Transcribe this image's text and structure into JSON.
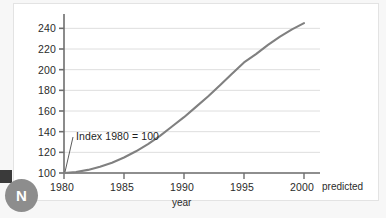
{
  "badge": {
    "letter": "N",
    "name": "n-logo-badge"
  },
  "chart_data": {
    "type": "line",
    "title": "",
    "xlabel": "year",
    "ylabel": "",
    "annotation": "Index 1980 = 100",
    "predicted_note": "predicted",
    "grid": true,
    "legend": "none",
    "xlim": [
      1980,
      2000
    ],
    "ylim": [
      100,
      250
    ],
    "xticks": [
      1980,
      1985,
      1990,
      1995,
      2000
    ],
    "xticklabels": [
      "1980",
      "1985",
      "1990",
      "1995",
      "2000"
    ],
    "yticks": [
      100,
      120,
      140,
      160,
      180,
      200,
      220,
      240
    ],
    "yticklabels": [
      "100",
      "120",
      "140",
      "160",
      "180",
      "200",
      "220",
      "240"
    ],
    "series": [
      {
        "name": "index",
        "color": "#808080",
        "x": [
          1980,
          1981,
          1982,
          1983,
          1984,
          1985,
          1986,
          1987,
          1988,
          1989,
          1990,
          1991,
          1992,
          1993,
          1994,
          1995,
          1996,
          1997,
          1998,
          1999,
          2000
        ],
        "values": [
          100,
          101,
          103,
          106,
          110,
          115,
          121,
          128,
          136,
          145,
          154,
          164,
          174,
          185,
          196,
          207,
          215,
          224,
          232,
          239,
          245
        ]
      }
    ]
  },
  "axis_colors": {
    "axis": "#6e6e6e",
    "grid": "#dedede",
    "curve": "#808080",
    "text": "#2b2b2b"
  }
}
